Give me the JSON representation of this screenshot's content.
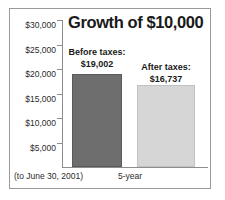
{
  "chart_data": {
    "type": "bar",
    "title": "Growth of $10,000",
    "xlabel": "5-year",
    "ylabel": "",
    "categories": [
      "Before taxes:",
      "After taxes:"
    ],
    "values": [
      19002,
      16737
    ],
    "value_labels": [
      "$19,002",
      "$16,737"
    ],
    "series": [
      {
        "name": "Before taxes:",
        "value": 19002,
        "value_label": "$19,002",
        "color": "#6e6e6e"
      },
      {
        "name": "After taxes:",
        "value": 16737,
        "value_label": "$16,737",
        "color": "#d6d6d6"
      }
    ],
    "ylim": [
      0,
      30000
    ],
    "yticks": [
      30000,
      25000,
      20000,
      15000,
      10000,
      5000
    ],
    "ytick_labels": [
      "$30,000",
      "$25,000",
      "$20,000",
      "$15,000",
      "$10,000",
      "$5,000"
    ],
    "grid": false,
    "legend": "none",
    "annotation": "(to June 30, 2001)"
  },
  "footnote": "(to June 30, 2001)",
  "colors": {
    "bar_before": "#6e6e6e",
    "bar_after": "#d6d6d6",
    "axis": "#8d8d8d",
    "frame": "#9a9a9a",
    "text": "#1a1a1a"
  }
}
